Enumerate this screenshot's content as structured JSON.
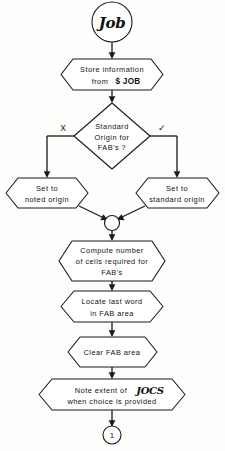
{
  "diagram": {
    "type": "flowchart",
    "title": "Job",
    "start_node": {
      "id": "start",
      "shape": "circle",
      "label": "Job",
      "style": "script"
    },
    "end_connector": {
      "id": "connector-1",
      "shape": "circle",
      "label": "1"
    },
    "nodes": [
      {
        "id": "store-information",
        "shape": "hexagon",
        "lines": [
          "Store information",
          "from"
        ],
        "line1": "Store information",
        "line2_prefix": "from",
        "line2_bold": "$ JOB"
      },
      {
        "id": "standard-origin-decision",
        "shape": "diamond",
        "line1": "Standard",
        "line2": "Origin for",
        "line3": "FAB's ?"
      },
      {
        "id": "set-noted-origin",
        "shape": "hexagon",
        "line1": "Set  to",
        "line2": "noted origin"
      },
      {
        "id": "set-standard-origin",
        "shape": "hexagon",
        "line1": "Set to",
        "line2": "standard origin"
      },
      {
        "id": "compute-cells",
        "shape": "hexagon",
        "line1": "Compute number",
        "line2": "of cells required for",
        "line3": "FAB's"
      },
      {
        "id": "locate-last-word",
        "shape": "hexagon",
        "line1": "Locate  last  word",
        "line2": "in FAB area"
      },
      {
        "id": "clear-fab-area",
        "shape": "hexagon",
        "line1": "Clear  FAB  area"
      },
      {
        "id": "note-extent",
        "shape": "hexagon",
        "line1_prefix": "Note extent of",
        "line1_script": "JOCS",
        "line2": "when choice is  provided"
      }
    ],
    "branch_labels": {
      "no": "X",
      "yes": "✓"
    },
    "junction": {
      "id": "merge-junction",
      "shape": "circle",
      "label": ""
    },
    "colors": {
      "stroke": "#1a1a1a",
      "fill": "#ffffff",
      "background": "#fdfdfc"
    }
  }
}
